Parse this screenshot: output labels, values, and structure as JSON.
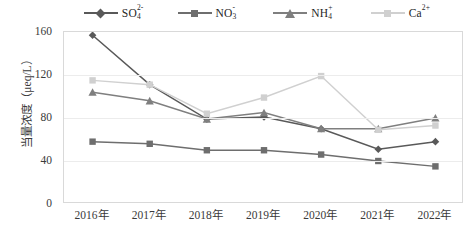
{
  "chart_data": {
    "type": "line",
    "title": "",
    "xlabel": "",
    "ylabel": "当量浓度（μeq/L）",
    "categories": [
      "2016年",
      "2017年",
      "2018年",
      "2019年",
      "2020年",
      "2021年",
      "2022年"
    ],
    "ylim": [
      0,
      160
    ],
    "yticks": [
      0,
      40,
      80,
      120,
      160
    ],
    "grid": true,
    "legend_position": "top",
    "series": [
      {
        "name": "SO4 2-",
        "label_base": "SO",
        "label_sub": "4",
        "label_sup": "2-",
        "marker": "diamond",
        "color": "#595959",
        "values": [
          157,
          111,
          79,
          81,
          70,
          51,
          58
        ]
      },
      {
        "name": "NO3 -",
        "label_base": "NO",
        "label_sub": "3",
        "label_sup": "-",
        "marker": "square",
        "color": "#6e6e6e",
        "values": [
          58,
          56,
          50,
          50,
          46,
          40,
          35
        ]
      },
      {
        "name": "NH4 +",
        "label_base": "NH",
        "label_sub": "4",
        "label_sup": "+",
        "marker": "triangle",
        "color": "#7f7f7f",
        "values": [
          104,
          96,
          79,
          85,
          70,
          70,
          80
        ]
      },
      {
        "name": "Ca 2+",
        "label_base": "Ca",
        "label_sub": "",
        "label_sup": "2+",
        "marker": "square",
        "color": "#d0d0d0",
        "values": [
          115,
          111,
          84,
          99,
          119,
          69,
          73
        ]
      }
    ]
  }
}
